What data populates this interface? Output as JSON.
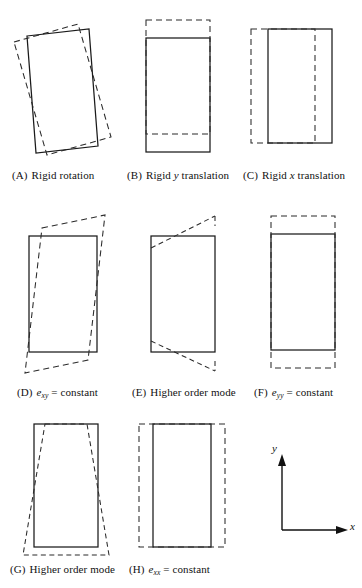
{
  "figure": {
    "axes": {
      "x_label": "x",
      "y_label": "y"
    },
    "panels": [
      {
        "tag": "(A)",
        "caption_plain": "Rigid rotation",
        "caption_parts": [
          {
            "text": "Rigid rotation",
            "style": "normal"
          }
        ],
        "mode": "rigid-rotation"
      },
      {
        "tag": "(B)",
        "caption_plain": "Rigid y translation",
        "caption_parts": [
          {
            "text": "Rigid ",
            "style": "normal"
          },
          {
            "text": "y",
            "style": "italic"
          },
          {
            "text": " translation",
            "style": "normal"
          }
        ],
        "mode": "rigid-y-translation"
      },
      {
        "tag": "(C)",
        "caption_plain": "Rigid x translation",
        "caption_parts": [
          {
            "text": "Rigid ",
            "style": "normal"
          },
          {
            "text": "x",
            "style": "italic"
          },
          {
            "text": " translation",
            "style": "normal"
          }
        ],
        "mode": "rigid-x-translation"
      },
      {
        "tag": "(D)",
        "caption_plain": "exy = constant",
        "caption_parts": [
          {
            "text": "e",
            "style": "italic"
          },
          {
            "text": "xy",
            "style": "subscript"
          },
          {
            "text": " = constant",
            "style": "normal"
          }
        ],
        "mode": "shear-exy-constant"
      },
      {
        "tag": "(E)",
        "caption_plain": "Higher order mode",
        "caption_parts": [
          {
            "text": "Higher order mode",
            "style": "normal"
          }
        ],
        "mode": "higher-order-mode-1"
      },
      {
        "tag": "(F)",
        "caption_plain": "eyy = constant",
        "caption_parts": [
          {
            "text": "e",
            "style": "italic"
          },
          {
            "text": "yy",
            "style": "subscript"
          },
          {
            "text": " = constant",
            "style": "normal"
          }
        ],
        "mode": "normal-strain-eyy-constant"
      },
      {
        "tag": "(G)",
        "caption_plain": "Higher order mode",
        "caption_parts": [
          {
            "text": "Higher order mode",
            "style": "normal"
          }
        ],
        "mode": "higher-order-mode-2"
      },
      {
        "tag": "(H)",
        "caption_plain": "exx = constant",
        "caption_parts": [
          {
            "text": "e",
            "style": "italic"
          },
          {
            "text": "xx",
            "style": "subscript"
          },
          {
            "text": " = constant",
            "style": "normal"
          }
        ],
        "mode": "normal-strain-exx-constant"
      }
    ],
    "colors": {
      "ink": "#1a1a1a",
      "dashed_ink": "#2a2a2a",
      "background": "#ffffff"
    }
  }
}
